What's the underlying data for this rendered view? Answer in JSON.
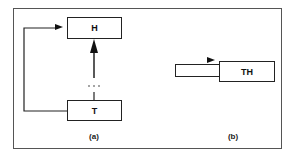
{
  "diagram": {
    "panel_a": {
      "caption": "(a)",
      "head_label": "H",
      "tail_label": "T",
      "ellipsis": "···"
    },
    "panel_b": {
      "caption": "(b)",
      "box_label": "TH"
    },
    "colors": {
      "stroke": "#222222",
      "frame": "#555555",
      "background": "#ffffff"
    }
  }
}
